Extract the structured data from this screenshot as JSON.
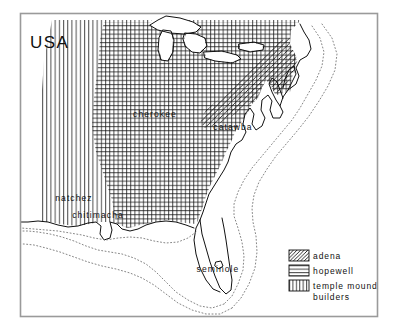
{
  "figure": {
    "type": "thematic-map",
    "region_label": "USA",
    "frame_color": "#9a9a9a",
    "ink_color": "#111111",
    "background": "#ffffff"
  },
  "map": {
    "country_label": "USA",
    "place_labels": [
      {
        "name": "cherokee",
        "x": 155,
        "y": 117
      },
      {
        "name": "catawba",
        "x": 233,
        "y": 130
      },
      {
        "name": "natchez",
        "x": 74,
        "y": 201
      },
      {
        "name": "chitimacha",
        "x": 98,
        "y": 218
      },
      {
        "name": "seminole",
        "x": 218,
        "y": 272
      }
    ],
    "features": {
      "coastline": "atlantic-and-gulf-coast",
      "great_lakes": "great-lakes-outline",
      "shelf_contours": "dotted-continental-shelf"
    }
  },
  "legend": {
    "items": [
      {
        "label": "adena",
        "pattern": "diagonal-hatch"
      },
      {
        "label": "hopewell",
        "pattern": "horizontal-lines"
      },
      {
        "label": "temple mound builders",
        "pattern": "vertical-lines"
      }
    ],
    "entries_text": [
      "adena",
      "hopewell",
      "temple mound",
      "builders"
    ]
  },
  "chart_data": {
    "type": "map",
    "title": "USA",
    "series": [
      {
        "name": "adena",
        "pattern": "diagonal-hatch",
        "region": "upper-ohio-valley"
      },
      {
        "name": "hopewell",
        "pattern": "horizontal-lines",
        "region": "ohio-and-mississippi-valleys"
      },
      {
        "name": "temple mound builders",
        "pattern": "vertical-lines",
        "region": "southeast-and-mississippi-valley"
      }
    ],
    "annotations": [
      "USA",
      "cherokee",
      "catawba",
      "natchez",
      "chitimacha",
      "seminole"
    ],
    "legend_position": "bottom-right",
    "grid": false
  }
}
